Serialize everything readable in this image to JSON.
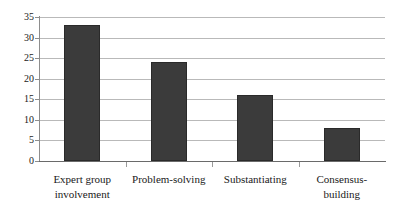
{
  "chart_data": {
    "type": "bar",
    "title": "",
    "subtitle": "",
    "xlabel": "",
    "ylabel": "",
    "categories": [
      "Expert group involvement",
      "Problem-solving",
      "Substantiating",
      "Consensus-building"
    ],
    "category_lines": [
      [
        "Expert group",
        "involvement"
      ],
      [
        "Problem-solving"
      ],
      [
        "Substantiating"
      ],
      [
        "Consensus-building"
      ]
    ],
    "values": [
      33,
      24,
      16,
      8
    ],
    "ylim": [
      0,
      35
    ],
    "ytick_step": 5,
    "yticks": [
      35,
      30,
      25,
      20,
      15,
      10,
      5,
      0
    ],
    "ytick_labels": [
      "35",
      "30",
      "25",
      "20",
      "15",
      "10",
      "5",
      "0"
    ],
    "grid": true,
    "grid_axis": "y",
    "legend": false,
    "legend_position": "none",
    "bar_color": "#3b3b3b",
    "bar_edge_color": "#2a2a2a",
    "gridline_color": "#b9b9b9",
    "axis_color": "#8d8d8d",
    "background_color": "#ffffff",
    "data_labels": false
  }
}
